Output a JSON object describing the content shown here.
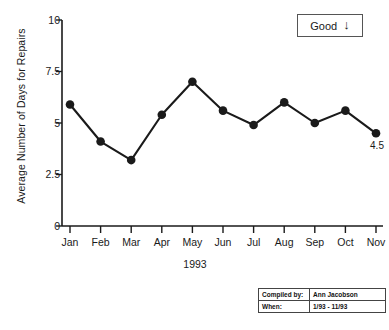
{
  "chart_data": {
    "type": "line",
    "title": "",
    "subtitle": "",
    "xlabel": "1993",
    "ylabel": "Average Number of Days for Repairs",
    "categories": [
      "Jan",
      "Feb",
      "Mar",
      "Apr",
      "May",
      "Jun",
      "Jul",
      "Aug",
      "Sep",
      "Oct",
      "Nov"
    ],
    "values": [
      5.9,
      4.1,
      3.2,
      5.4,
      7.0,
      5.6,
      4.9,
      6.0,
      5.0,
      5.6,
      4.5
    ],
    "ylim": [
      0,
      10
    ],
    "yticks": [
      0,
      2.5,
      5,
      7.5,
      10
    ],
    "ytick_labels": [
      "0",
      "2.5",
      "5",
      "7.5",
      "10"
    ],
    "grid": false,
    "legend": "none",
    "marker": "filled-circle",
    "series_color": "#1a1a1a",
    "annotations": [
      {
        "name": "last-point-value",
        "text": "4.5",
        "category": "Nov",
        "value": 4.5
      }
    ]
  },
  "good_indicator": {
    "label": "Good",
    "direction_icon": "arrow-down-icon",
    "direction_glyph": "↓"
  },
  "info_table": {
    "rows": [
      {
        "label": "Compiled by:",
        "value": "Ann Jacobson"
      },
      {
        "label": "When:",
        "value": "1/93 - 11/93"
      }
    ]
  }
}
